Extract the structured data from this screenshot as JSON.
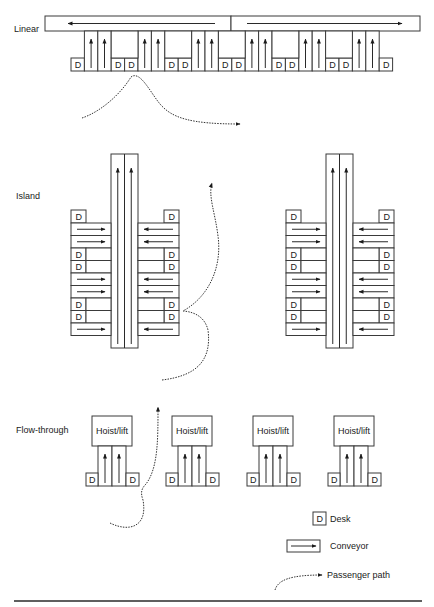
{
  "sections": {
    "linear": {
      "label": "Linear"
    },
    "island": {
      "label": "Island"
    },
    "flow_through": {
      "label": "Flow-through"
    }
  },
  "desk_label": "D",
  "hoist_label": "Hoist/lift",
  "legend": {
    "desk": {
      "symbol": "D",
      "label": "Desk"
    },
    "conveyor": {
      "label": "Conveyor"
    },
    "passenger_path": {
      "label": "Passenger path"
    }
  },
  "colors": {
    "stroke": "#2a2a2a",
    "background": "#ffffff",
    "text": "#1a1a1a"
  },
  "linear_layout": {
    "main_conveyor": {
      "directions": [
        "left",
        "right"
      ]
    },
    "units": [
      {
        "type": "desk"
      },
      {
        "type": "chute"
      },
      {
        "type": "chute"
      },
      {
        "type": "desk"
      },
      {
        "type": "desk"
      },
      {
        "type": "chute"
      },
      {
        "type": "chute"
      },
      {
        "type": "desk"
      },
      {
        "type": "desk"
      },
      {
        "type": "chute"
      },
      {
        "type": "chute"
      },
      {
        "type": "desk"
      },
      {
        "type": "desk"
      },
      {
        "type": "chute"
      },
      {
        "type": "chute"
      },
      {
        "type": "desk"
      },
      {
        "type": "desk"
      },
      {
        "type": "chute"
      },
      {
        "type": "chute"
      },
      {
        "type": "desk"
      },
      {
        "type": "desk"
      },
      {
        "type": "chute"
      },
      {
        "type": "chute"
      },
      {
        "type": "desk"
      }
    ]
  },
  "island_layout": {
    "count": 2,
    "rows": [
      "desk",
      "conveyor",
      "conveyor",
      "desk",
      "desk",
      "conveyor",
      "conveyor",
      "desk",
      "desk",
      "conveyor"
    ],
    "left_side_arrow": "right",
    "right_side_arrow": "left",
    "central_conveyors": 2,
    "central_arrow": "up"
  },
  "flow_through_layout": {
    "count": 4,
    "unit": [
      "desk",
      "chute",
      "chute",
      "desk"
    ]
  }
}
